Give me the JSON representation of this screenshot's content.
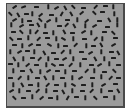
{
  "stimulus": {
    "type": "visual-search-array",
    "background_color": "#9b9b9b",
    "border_color": "#4a4a4a",
    "item_color": "#1e1e1e",
    "item_shape": "line-segment",
    "segments": [
      [
        13,
        6,
        -35
      ],
      [
        22,
        6,
        -20
      ],
      [
        35,
        6,
        0
      ],
      [
        47,
        6,
        90
      ],
      [
        55,
        7,
        -30
      ],
      [
        64,
        7,
        60
      ],
      [
        72,
        6,
        45
      ],
      [
        82,
        7,
        0
      ],
      [
        94,
        6,
        -45
      ],
      [
        104,
        5,
        0
      ],
      [
        112,
        6,
        90
      ],
      [
        9,
        13,
        45
      ],
      [
        17,
        14,
        60
      ],
      [
        25,
        13,
        0
      ],
      [
        31,
        13,
        90
      ],
      [
        39,
        14,
        -40
      ],
      [
        50,
        14,
        0
      ],
      [
        60,
        13,
        -60
      ],
      [
        70,
        13,
        60
      ],
      [
        80,
        12,
        -40
      ],
      [
        93,
        12,
        45
      ],
      [
        101,
        11,
        0
      ],
      [
        113,
        13,
        90
      ],
      [
        13,
        19,
        -30
      ],
      [
        21,
        20,
        90
      ],
      [
        28,
        20,
        0
      ],
      [
        39,
        19,
        45
      ],
      [
        47,
        20,
        -30
      ],
      [
        55,
        19,
        90
      ],
      [
        66,
        19,
        0
      ],
      [
        76,
        19,
        90
      ],
      [
        85,
        20,
        -40
      ],
      [
        98,
        20,
        0
      ],
      [
        108,
        19,
        60
      ],
      [
        116,
        19,
        90
      ],
      [
        10,
        24,
        90
      ],
      [
        20,
        25,
        -30
      ],
      [
        30,
        24,
        0
      ],
      [
        37,
        24,
        60
      ],
      [
        44,
        25,
        90
      ],
      [
        58,
        25,
        0
      ],
      [
        65,
        24,
        -45
      ],
      [
        73,
        25,
        60
      ],
      [
        84,
        25,
        90
      ],
      [
        93,
        25,
        -30
      ],
      [
        106,
        26,
        0
      ],
      [
        116,
        24,
        90
      ],
      [
        12,
        31,
        0
      ],
      [
        20,
        31,
        45
      ],
      [
        29,
        31,
        90
      ],
      [
        35,
        31,
        -50
      ],
      [
        44,
        32,
        0
      ],
      [
        52,
        32,
        90
      ],
      [
        63,
        31,
        60
      ],
      [
        71,
        32,
        0
      ],
      [
        82,
        31,
        -30
      ],
      [
        90,
        32,
        90
      ],
      [
        103,
        31,
        0
      ],
      [
        112,
        32,
        45
      ],
      [
        10,
        38,
        45
      ],
      [
        18,
        38,
        0
      ],
      [
        27,
        37,
        90
      ],
      [
        37,
        38,
        -45
      ],
      [
        46,
        37,
        0
      ],
      [
        55,
        38,
        90
      ],
      [
        62,
        38,
        30
      ],
      [
        72,
        38,
        90
      ],
      [
        83,
        38,
        0
      ],
      [
        94,
        38,
        -45
      ],
      [
        101,
        38,
        90
      ],
      [
        114,
        37,
        0
      ],
      [
        13,
        44,
        0
      ],
      [
        21,
        45,
        90
      ],
      [
        29,
        44,
        -30
      ],
      [
        37,
        44,
        0
      ],
      [
        48,
        44,
        30
      ],
      [
        57,
        45,
        90
      ],
      [
        64,
        45,
        0
      ],
      [
        74,
        44,
        -45
      ],
      [
        85,
        45,
        90
      ],
      [
        92,
        45,
        0
      ],
      [
        100,
        44,
        60
      ],
      [
        112,
        44,
        -30
      ],
      [
        9,
        51,
        90
      ],
      [
        18,
        51,
        -30
      ],
      [
        26,
        50,
        0
      ],
      [
        33,
        51,
        90
      ],
      [
        43,
        52,
        60
      ],
      [
        52,
        52,
        0
      ],
      [
        61,
        51,
        -45
      ],
      [
        69,
        51,
        90
      ],
      [
        80,
        51,
        0
      ],
      [
        89,
        52,
        -30
      ],
      [
        100,
        51,
        90
      ],
      [
        110,
        51,
        0
      ],
      [
        117,
        52,
        60
      ],
      [
        13,
        58,
        60
      ],
      [
        22,
        58,
        90
      ],
      [
        31,
        57,
        0
      ],
      [
        38,
        58,
        -45
      ],
      [
        47,
        58,
        90
      ],
      [
        55,
        58,
        0
      ],
      [
        63,
        58,
        -30
      ],
      [
        72,
        58,
        90
      ],
      [
        83,
        58,
        0
      ],
      [
        94,
        58,
        60
      ],
      [
        103,
        58,
        90
      ],
      [
        112,
        57,
        0
      ],
      [
        9,
        63,
        0
      ],
      [
        17,
        64,
        90
      ],
      [
        26,
        64,
        -40
      ],
      [
        35,
        64,
        0
      ],
      [
        45,
        64,
        90
      ],
      [
        52,
        64,
        30
      ],
      [
        60,
        64,
        0
      ],
      [
        69,
        64,
        -45
      ],
      [
        79,
        64,
        90
      ],
      [
        90,
        64,
        0
      ],
      [
        98,
        64,
        -30
      ],
      [
        108,
        63,
        90
      ],
      [
        117,
        64,
        0
      ],
      [
        12,
        70,
        90
      ],
      [
        21,
        70,
        0
      ],
      [
        30,
        70,
        60
      ],
      [
        39,
        71,
        90
      ],
      [
        47,
        70,
        -30
      ],
      [
        56,
        70,
        0
      ],
      [
        64,
        71,
        90
      ],
      [
        73,
        70,
        0
      ],
      [
        85,
        70,
        -45
      ],
      [
        93,
        70,
        90
      ],
      [
        103,
        71,
        0
      ],
      [
        113,
        70,
        45
      ],
      [
        9,
        77,
        0
      ],
      [
        18,
        77,
        -45
      ],
      [
        27,
        77,
        90
      ],
      [
        36,
        77,
        0
      ],
      [
        44,
        77,
        60
      ],
      [
        52,
        77,
        90
      ],
      [
        61,
        77,
        0
      ],
      [
        71,
        77,
        90
      ],
      [
        79,
        77,
        -30
      ],
      [
        91,
        77,
        0
      ],
      [
        100,
        76,
        90
      ],
      [
        109,
        77,
        -45
      ],
      [
        117,
        77,
        0
      ],
      [
        12,
        84,
        90
      ],
      [
        21,
        84,
        60
      ],
      [
        29,
        84,
        0
      ],
      [
        37,
        84,
        90
      ],
      [
        46,
        84,
        -45
      ],
      [
        55,
        84,
        0
      ],
      [
        64,
        84,
        90
      ],
      [
        72,
        84,
        30
      ],
      [
        82,
        84,
        0
      ],
      [
        91,
        84,
        90
      ],
      [
        102,
        84,
        -30
      ],
      [
        114,
        83,
        0
      ],
      [
        10,
        90,
        -30
      ],
      [
        18,
        90,
        90
      ],
      [
        27,
        90,
        0
      ],
      [
        36,
        90,
        -45
      ],
      [
        45,
        90,
        90
      ],
      [
        54,
        90,
        0
      ],
      [
        62,
        91,
        60
      ],
      [
        71,
        90,
        90
      ],
      [
        81,
        90,
        0
      ],
      [
        90,
        90,
        -45
      ],
      [
        100,
        90,
        90
      ],
      [
        109,
        90,
        0
      ],
      [
        117,
        90,
        60
      ],
      [
        13,
        97,
        45
      ],
      [
        22,
        97,
        0
      ],
      [
        31,
        96,
        90
      ],
      [
        40,
        97,
        -40
      ],
      [
        49,
        97,
        0
      ],
      [
        56,
        97,
        90
      ],
      [
        66,
        97,
        -60
      ],
      [
        75,
        96,
        0
      ],
      [
        84,
        97,
        90
      ],
      [
        94,
        97,
        45
      ],
      [
        104,
        96,
        0
      ],
      [
        113,
        97,
        90
      ]
    ]
  }
}
